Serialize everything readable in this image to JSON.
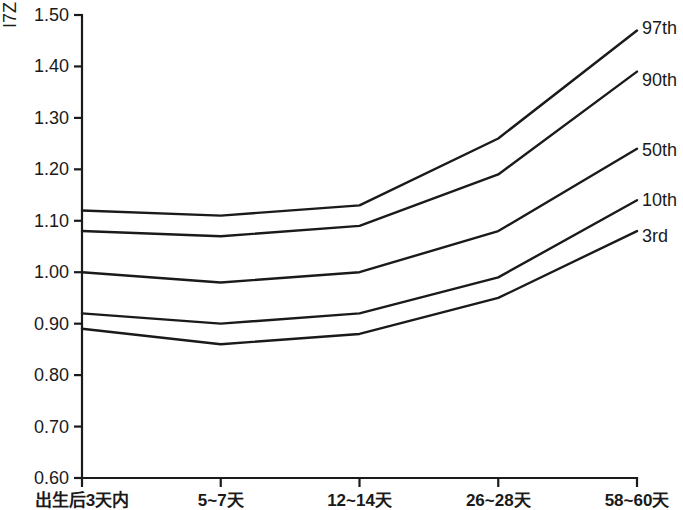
{
  "chart_data": {
    "type": "line",
    "title": "",
    "subtitle": "",
    "xlabel": "",
    "ylabel": "I7Z",
    "ylim": [
      0.6,
      1.5
    ],
    "ytick_step": 0.1,
    "yticks": [
      "0.60",
      "0.70",
      "0.80",
      "0.90",
      "1.00",
      "1.10",
      "1.20",
      "1.30",
      "1.40",
      "1.50"
    ],
    "categories": [
      "出生后3天内",
      "5~7天",
      "12~14天",
      "26~28天",
      "58~60天"
    ],
    "grid": false,
    "legend_position": "right-inline-labels",
    "line_color": "#1a1a1a",
    "series": [
      {
        "name": "97th",
        "values": [
          1.12,
          1.11,
          1.13,
          1.26,
          1.47
        ]
      },
      {
        "name": "90th",
        "values": [
          1.08,
          1.07,
          1.09,
          1.19,
          1.39
        ]
      },
      {
        "name": "50th",
        "values": [
          1.0,
          0.98,
          1.0,
          1.08,
          1.24
        ]
      },
      {
        "name": "10th",
        "values": [
          0.92,
          0.9,
          0.92,
          0.99,
          1.14
        ]
      },
      {
        "name": "3rd",
        "values": [
          0.89,
          0.86,
          0.88,
          0.95,
          1.08
        ]
      }
    ]
  },
  "axis": {
    "y_label_text": "I7Z"
  }
}
